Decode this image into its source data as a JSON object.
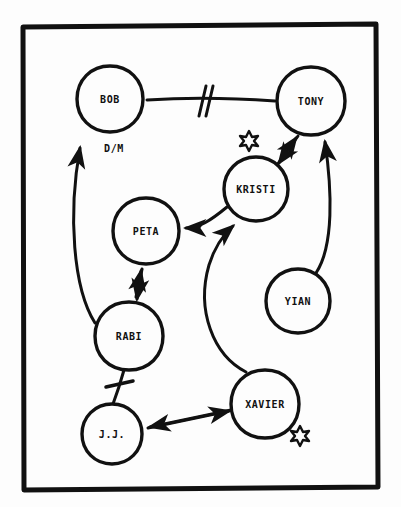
{
  "diagram": {
    "ink_color": "#111111",
    "paper_color": "#fdfdfd",
    "frame": {
      "x": 21,
      "y": 23,
      "width": 357,
      "height": 466,
      "stroke_width": 5
    },
    "nodes": [
      {
        "id": "bob",
        "label": "BOB",
        "cx": 110,
        "cy": 99,
        "r": 33
      },
      {
        "id": "tony",
        "label": "TONY",
        "cx": 311,
        "cy": 101,
        "r": 34
      },
      {
        "id": "kristi",
        "label": "KRISTI",
        "cx": 256,
        "cy": 189,
        "r": 32
      },
      {
        "id": "peta",
        "label": "PETA",
        "cx": 146,
        "cy": 231,
        "r": 33
      },
      {
        "id": "yian",
        "label": "YIAN",
        "cx": 298,
        "cy": 301,
        "r": 32
      },
      {
        "id": "rabi",
        "label": "RABI",
        "cx": 129,
        "cy": 336,
        "r": 34
      },
      {
        "id": "xavier",
        "label": "XAVIER",
        "cx": 265,
        "cy": 404,
        "r": 34
      },
      {
        "id": "jj",
        "label": "J.J.",
        "cx": 112,
        "cy": 434,
        "r": 30
      }
    ],
    "edge_labels": [
      {
        "id": "dm",
        "text": "D/M",
        "x": 114,
        "y": 148
      }
    ],
    "edges": [
      {
        "id": "bob-tony",
        "from": "bob",
        "to": "tony",
        "style": "severed-double-slash",
        "arrow": "none"
      },
      {
        "id": "kristi-tony",
        "from": "kristi",
        "to": "tony",
        "style": "straight",
        "arrow": "both"
      },
      {
        "id": "yian-tony",
        "from": "yian",
        "to": "tony",
        "style": "curved",
        "arrow": "to"
      },
      {
        "id": "kristi-peta",
        "from": "kristi",
        "to": "peta",
        "style": "curved",
        "arrow": "to"
      },
      {
        "id": "peta-rabi",
        "from": "peta",
        "to": "rabi",
        "style": "straight",
        "arrow": "both"
      },
      {
        "id": "rabi-bob",
        "from": "rabi",
        "to": "bob",
        "style": "curved",
        "arrow": "to"
      },
      {
        "id": "rabi-jj",
        "from": "rabi",
        "to": "jj",
        "style": "severed-single-slash",
        "arrow": "none"
      },
      {
        "id": "xavier-jj",
        "from": "xavier",
        "to": "jj",
        "style": "straight",
        "arrow": "both"
      },
      {
        "id": "xavier-kristi",
        "from": "xavier",
        "to": "kristi",
        "style": "curved",
        "arrow": "to"
      }
    ],
    "markers": [
      {
        "id": "star-kristi",
        "type": "star-icon",
        "x": 249,
        "y": 140,
        "size": 13
      },
      {
        "id": "star-xavier",
        "type": "star-icon",
        "x": 300,
        "y": 435,
        "size": 13
      }
    ]
  }
}
